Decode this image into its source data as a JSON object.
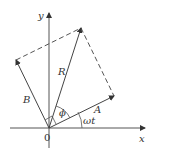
{
  "diagram": {
    "type": "phasor-diagram",
    "labels": {
      "x_axis": "x",
      "y_axis": "y",
      "origin": "0",
      "vector_A": "A",
      "vector_B": "B",
      "vector_R": "R",
      "angle_phi": "ϕ",
      "angle_omega_t": "ωt"
    },
    "colors": {
      "line": "#333333",
      "background": "#ffffff"
    }
  }
}
